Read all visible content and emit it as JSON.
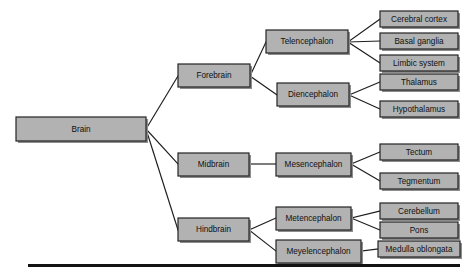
{
  "diagram": {
    "type": "hierarchy-tree",
    "style": {
      "box_fill": "#b2b2b2",
      "box_border": "#242424",
      "box_shadow": "#8d8d8d",
      "line_color": "#1d1d1d",
      "text_color": "#101010",
      "background": "#ffffff",
      "footer_rule_color": "#121212"
    },
    "nodes": {
      "root": {
        "label": "Brain",
        "x": 16,
        "y": 117,
        "w": 130,
        "h": 24,
        "font_size": 8.2
      },
      "forebrain": {
        "label": "Forebrain",
        "x": 178,
        "y": 64,
        "w": 72,
        "h": 23,
        "font_size": 8.2
      },
      "midbrain": {
        "label": "Midbrain",
        "x": 178,
        "y": 153,
        "w": 71,
        "h": 23,
        "font_size": 8.2
      },
      "hindbrain": {
        "label": "Hindbrain",
        "x": 178,
        "y": 218,
        "w": 71,
        "h": 23,
        "font_size": 8.2
      },
      "telencephalon": {
        "label": "Telencephalon",
        "x": 266,
        "y": 30,
        "w": 82,
        "h": 23,
        "font_size": 8.2
      },
      "diencephalon": {
        "label": "Diencephalon",
        "x": 277,
        "y": 83,
        "w": 72,
        "h": 23,
        "font_size": 8.2
      },
      "mesencephalon": {
        "label": "Mesencephalon",
        "x": 276,
        "y": 153,
        "w": 75,
        "h": 23,
        "font_size": 8.2
      },
      "metencephalon": {
        "label": "Metencephalon",
        "x": 276,
        "y": 207,
        "w": 75,
        "h": 23,
        "font_size": 8.2
      },
      "meyelencephalon": {
        "label": "Meyelencephalon",
        "x": 276,
        "y": 240,
        "w": 85,
        "h": 23,
        "font_size": 8.2
      },
      "cerebral_cortex": {
        "label": "Cerebral cortex",
        "x": 380,
        "y": 11,
        "w": 78,
        "h": 16,
        "font_size": 8.2
      },
      "basal_ganglia": {
        "label": "Basal ganglia",
        "x": 380,
        "y": 33,
        "w": 78,
        "h": 16,
        "font_size": 8.2
      },
      "limbic_system": {
        "label": "Limbic system",
        "x": 380,
        "y": 55,
        "w": 78,
        "h": 16,
        "font_size": 8.2
      },
      "thalamus": {
        "label": "Thalamus",
        "x": 380,
        "y": 74,
        "w": 78,
        "h": 16,
        "font_size": 8.2
      },
      "hypothalamus": {
        "label": "Hypothalamus",
        "x": 380,
        "y": 101,
        "w": 78,
        "h": 16,
        "font_size": 8.2
      },
      "tectum": {
        "label": "Tectum",
        "x": 380,
        "y": 144,
        "w": 78,
        "h": 16,
        "font_size": 8.2
      },
      "tegmentum": {
        "label": "Tegmentum",
        "x": 380,
        "y": 173,
        "w": 78,
        "h": 16,
        "font_size": 8.2
      },
      "cerebellum": {
        "label": "Cerebellum",
        "x": 380,
        "y": 203,
        "w": 78,
        "h": 16,
        "font_size": 8.2
      },
      "pons": {
        "label": "Pons",
        "x": 380,
        "y": 222,
        "w": 78,
        "h": 16,
        "font_size": 8.2
      },
      "medulla_oblongata": {
        "label": "Medulla oblongata",
        "x": 378,
        "y": 241,
        "w": 82,
        "h": 16,
        "font_size": 8.2
      }
    },
    "edges": [
      {
        "name": "brain-to-forebrain",
        "from": "root",
        "to": "forebrain",
        "points": "146,129 178,76"
      },
      {
        "name": "brain-to-midbrain",
        "from": "root",
        "to": "midbrain",
        "points": "146,129 178,164"
      },
      {
        "name": "brain-to-hindbrain",
        "from": "root",
        "to": "hindbrain",
        "points": "146,129 178,230"
      },
      {
        "name": "forebrain-to-telencephalon",
        "from": "forebrain",
        "to": "telencephalon",
        "points": "250,76 266,42"
      },
      {
        "name": "forebrain-to-diencephalon",
        "from": "forebrain",
        "to": "diencephalon",
        "points": "250,76 277,95"
      },
      {
        "name": "telencephalon-to-cerebral-cortex",
        "from": "telencephalon",
        "to": "cerebral_cortex",
        "points": "348,42 380,19"
      },
      {
        "name": "telencephalon-to-basal-ganglia",
        "from": "telencephalon",
        "to": "basal_ganglia",
        "points": "348,42 380,41"
      },
      {
        "name": "telencephalon-to-limbic-system",
        "from": "telencephalon",
        "to": "limbic_system",
        "points": "348,42 380,63"
      },
      {
        "name": "diencephalon-to-thalamus",
        "from": "diencephalon",
        "to": "thalamus",
        "points": "349,95 380,82"
      },
      {
        "name": "diencephalon-to-hypothalamus",
        "from": "diencephalon",
        "to": "hypothalamus",
        "points": "349,95 380,109"
      },
      {
        "name": "midbrain-to-mesencephalon",
        "from": "midbrain",
        "to": "mesencephalon",
        "points": "249,164 276,164"
      },
      {
        "name": "mesencephalon-to-tectum",
        "from": "mesencephalon",
        "to": "tectum",
        "points": "351,164 380,152"
      },
      {
        "name": "mesencephalon-to-tegmentum",
        "from": "mesencephalon",
        "to": "tegmentum",
        "points": "351,164 380,181"
      },
      {
        "name": "hindbrain-to-metencephalon",
        "from": "hindbrain",
        "to": "metencephalon",
        "points": "249,230 276,218"
      },
      {
        "name": "hindbrain-to-meyelencephalon",
        "from": "hindbrain",
        "to": "meyelencephalon",
        "points": "249,230 276,251"
      },
      {
        "name": "metencephalon-to-cerebellum",
        "from": "metencephalon",
        "to": "cerebellum",
        "points": "351,218 380,211"
      },
      {
        "name": "metencephalon-to-pons",
        "from": "metencephalon",
        "to": "pons",
        "points": "351,218 380,230"
      },
      {
        "name": "meyelencephalon-to-medulla",
        "from": "meyelencephalon",
        "to": "medulla_oblongata",
        "points": "361,251 378,249"
      }
    ],
    "footer_rule": {
      "x": 28,
      "y": 264,
      "w": 432,
      "h": 3
    }
  }
}
